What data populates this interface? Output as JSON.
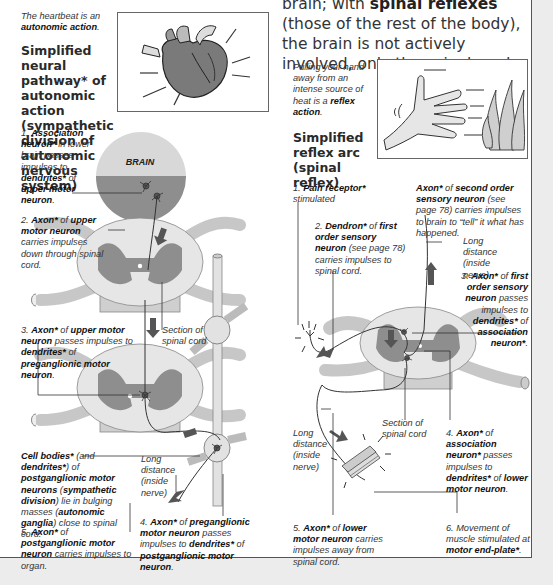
{
  "page": {
    "intro_text": {
      "pre": "brain; with ",
      "bold": "spinal reflexes",
      "post": " (those of the rest of the body), the brain is not actively involved, only the spinal cord."
    },
    "left": {
      "caption_heart": {
        "pre": "The heartbeat is an ",
        "bold": "autonomic action",
        "post": "."
      },
      "heading": "Simplified neural pathway* of autonomic action (sympathetic division of autonomic nervous system)",
      "brain_label": "BRAIN",
      "step1": {
        "num": "1. ",
        "b1": "Association neuron*",
        "t1": " in lower brain passes impulses to ",
        "b2": "dendrites*",
        "t2": " of ",
        "b3": "upper motor neuron",
        "t3": "."
      },
      "step2": {
        "num": "2. ",
        "b1": "Axon*",
        "t1": " of ",
        "b2": "upper motor neuron",
        "t2": " carries impulses down through spinal cord."
      },
      "section_label": "Section of spinal cord",
      "step3": {
        "num": "3. ",
        "b1": "Axon*",
        "t1": " of ",
        "b2": "upper motor neuron",
        "t2": " passes impulses to ",
        "b3": "dendrites*",
        "t3": " of ",
        "b4": "preganglionic motor neuron",
        "t4": "."
      },
      "cell_bodies": {
        "b1": "Cell bodies*",
        "t1": " (and ",
        "b2": "dendrites*",
        "t2": ") of ",
        "b3": "postganglionic motor neurons",
        "t3": " (",
        "b4": "sympathetic division",
        "t4": ") lie in bulging masses (",
        "b5": "autonomic ganglia",
        "t5": ") close to spinal cord."
      },
      "long_distance": "Long distance (inside nerve)",
      "step4": {
        "num": "4. ",
        "b1": "Axon*",
        "t1": " of ",
        "b2": "preganglionic motor neuron",
        "t2": " passes impulses to ",
        "b3": "dendrites*",
        "t3": " of ",
        "b4": "postganglionic motor neuron",
        "t4": "."
      },
      "step5": {
        "num": "5. ",
        "b1": "Axon*",
        "t1": " of ",
        "b2": "postganglionic motor neuron",
        "t2": " carries impulses to organ."
      }
    },
    "right": {
      "caption_hand": {
        "pre": "Pulling your hand away from an intense source of heat is a ",
        "bold": "reflex action",
        "post": "."
      },
      "heading": "Simplified reflex arc (spinal reflex)",
      "step1": {
        "num": "1. ",
        "b1": "Pain receptor*",
        "t1": " stimulated"
      },
      "axon_second": {
        "b1": "Axon*",
        "t1": " of ",
        "b2": "second order sensory neuron",
        "t2": " (see page 78) carries impulses to brain to “tell” it what has happened."
      },
      "step2": {
        "num": "2. ",
        "b1": "Dendron*",
        "t1": " of ",
        "b2": "first order sensory neuron",
        "t2": " (see page 78) carries impulses to spinal cord."
      },
      "long_distance_top": "Long distance (inside nerve)",
      "step3": {
        "num": "3. ",
        "b1": "Axon*",
        "t1": " of ",
        "b2": "first order sensory neuron",
        "t2": " passes impulses to ",
        "b3": "dendrites*",
        "t3": " of ",
        "b4": "association neuron*",
        "t4": "."
      },
      "section_label": "Section of spinal cord",
      "long_distance_bottom": "Long distance (inside nerve)",
      "step4": {
        "num": "4. ",
        "b1": "Axon*",
        "t1": " of ",
        "b2": "association neuron*",
        "t2": " passes impulses to ",
        "b3": "dendrites*",
        "t3": " of ",
        "b4": "lower motor neuron",
        "t4": "."
      },
      "step5": {
        "num": "5. ",
        "b1": "Axon*",
        "t1": " of ",
        "b2": "lower motor neuron",
        "t2": " carries impulses away from spinal cord."
      },
      "step6": {
        "num": "6. ",
        "t1": "Movement of muscle stimulated at ",
        "b1": "motor end-plate*",
        "t2": "."
      }
    },
    "colors": {
      "page_bg": "#ffffff",
      "outer_bg": "#ececec",
      "cord_white": "#e2e2e2",
      "cord_grey": "#8c8c8c",
      "brain_light": "#d6d6d6",
      "brain_dark": "#8e8e8e",
      "arrow": "#555555",
      "nerve_line": "#333333"
    }
  }
}
